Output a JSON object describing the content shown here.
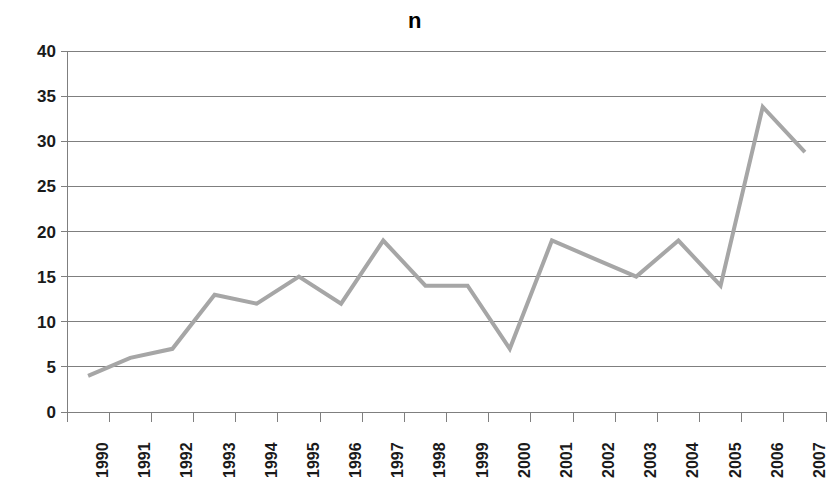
{
  "chart_data": {
    "type": "line",
    "title": "n",
    "xlabel": "",
    "ylabel": "",
    "categories": [
      "1990",
      "1991",
      "1992",
      "1993",
      "1994",
      "1995",
      "1996",
      "1997",
      "1998",
      "1999",
      "2000",
      "2001",
      "2002",
      "2003",
      "2004",
      "2005",
      "2006",
      "2007"
    ],
    "values": [
      4,
      6,
      7,
      13,
      12,
      15,
      12,
      19,
      14,
      14,
      7,
      19,
      17,
      15,
      19,
      14,
      33.8,
      28.8
    ],
    "series": [
      {
        "name": "n",
        "values": [
          4,
          6,
          7,
          13,
          12,
          15,
          12,
          19,
          14,
          14,
          7,
          19,
          17,
          15,
          19,
          14,
          33.8,
          28.8
        ]
      }
    ],
    "ylim": [
      0,
      40
    ],
    "yticks": [
      0,
      5,
      10,
      15,
      20,
      25,
      30,
      35,
      40
    ],
    "ytick_labels": [
      "0",
      "5",
      "10",
      "15",
      "20",
      "25",
      "30",
      "35",
      "40"
    ],
    "grid": true,
    "grid_axis": "y",
    "legend": false,
    "legend_position": "none",
    "markers": false,
    "line_color": "#a6a6a6",
    "line_width": 4,
    "grid_color": "#7f7f7f",
    "axis_color": "#7f7f7f",
    "text_color": "#1a1a1a",
    "background": "#ffffff",
    "xtick_rotation": -90
  }
}
